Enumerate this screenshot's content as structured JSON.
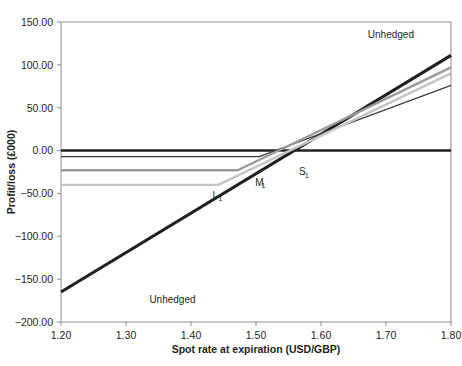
{
  "chart_data": {
    "type": "line",
    "title": "",
    "xlabel": "Spot rate at expiration (USD/GBP)",
    "ylabel": "Profit/loss (£000)",
    "xlim": [
      1.2,
      1.8
    ],
    "ylim": [
      -200.0,
      150.0
    ],
    "grid": false,
    "legend_position": "inline-annotations",
    "xticks": [
      "1.20",
      "1.30",
      "1.40",
      "1.50",
      "1.60",
      "1.70",
      "1.80"
    ],
    "xtick_values": [
      1.2,
      1.3,
      1.4,
      1.5,
      1.6,
      1.7,
      1.8
    ],
    "yticks": [
      "150.00",
      "100.00",
      "50.00",
      "0.00",
      "−50.00",
      "−100.00",
      "−150.00",
      "−200.00"
    ],
    "ytick_values": [
      150,
      100,
      50,
      0,
      -50,
      -100,
      -150,
      -200
    ],
    "series": [
      {
        "name": "Unhedged",
        "label": "Unhedged",
        "color": "#231f20",
        "width": 3.1,
        "points": [
          [
            1.2,
            -165.0
          ],
          [
            1.8,
            111.0
          ]
        ]
      },
      {
        "name": "Zero line",
        "label": "",
        "color": "#231f20",
        "width": 2.6,
        "points": [
          [
            1.2,
            0.0
          ],
          [
            1.8,
            0.0
          ]
        ]
      },
      {
        "name": "L1",
        "label": "L₁",
        "color": "#3c3c3c",
        "width": 1.2,
        "points": [
          [
            1.2,
            -7.0
          ],
          [
            1.505,
            -7.0
          ],
          [
            1.8,
            76.0
          ]
        ]
      },
      {
        "name": "M1",
        "label": "M₁",
        "color": "#9a9a9a",
        "width": 2.4,
        "points": [
          [
            1.2,
            -23.0
          ],
          [
            1.472,
            -23.0
          ],
          [
            1.8,
            97.0
          ]
        ]
      },
      {
        "name": "S1",
        "label": "S₁",
        "color": "#c4c4c4",
        "width": 2.4,
        "points": [
          [
            1.2,
            -40.0
          ],
          [
            1.442,
            -40.0
          ],
          [
            1.8,
            90.0
          ]
        ]
      }
    ],
    "annotations": [
      {
        "text": "Unhedged",
        "name": "annotation-unhedged-upper",
        "x": 1.672,
        "y": 131.0,
        "sub": ""
      },
      {
        "text": "Unhedged",
        "name": "annotation-unhedged-lower",
        "x": 1.336,
        "y": -178.0,
        "sub": ""
      },
      {
        "text": "L",
        "name": "annotation-l1",
        "x": 1.433,
        "y": -56.0,
        "sub": "1"
      },
      {
        "text": "M",
        "name": "annotation-m1",
        "x": 1.499,
        "y": -41.0,
        "sub": "1"
      },
      {
        "text": "S",
        "name": "annotation-s1",
        "x": 1.566,
        "y": -29.0,
        "sub": "1"
      }
    ],
    "colors": {
      "frame": "#8d8d8d",
      "text": "#231f20",
      "background": "#ffffff"
    }
  }
}
